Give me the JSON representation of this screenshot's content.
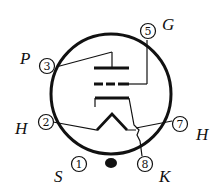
{
  "diagram": {
    "colors": {
      "stroke": "#111111",
      "background": "#ffffff"
    },
    "envelope": {
      "cx": 111,
      "cy": 94,
      "r": 60
    },
    "pins": [
      {
        "number": "5",
        "label": "G",
        "name": "grid"
      },
      {
        "number": "3",
        "label": "P",
        "name": "plate"
      },
      {
        "number": "2",
        "label": "H",
        "name": "heater"
      },
      {
        "number": "7",
        "label": "H",
        "name": "heater"
      },
      {
        "number": "1",
        "label": "S",
        "name": "shield"
      },
      {
        "number": "8",
        "label": "K",
        "name": "cathode"
      }
    ],
    "elements": [
      "plate",
      "grid",
      "cathode",
      "heater",
      "base-key"
    ]
  }
}
